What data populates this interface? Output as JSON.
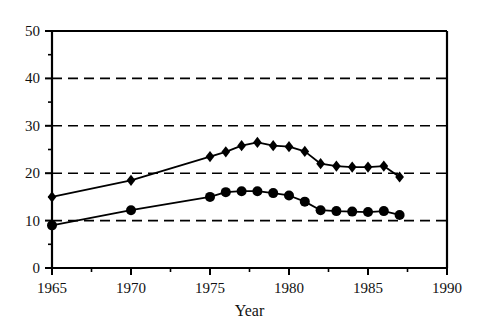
{
  "chart_data": {
    "type": "line",
    "title": "",
    "xlabel": "Year",
    "ylabel": "",
    "xlim": [
      1965,
      1990
    ],
    "ylim": [
      0,
      50
    ],
    "grid": true,
    "gridlines_y": [
      10,
      20,
      30,
      40
    ],
    "legend": "none",
    "xticks": [
      1965,
      1970,
      1975,
      1980,
      1985,
      1990
    ],
    "xtick_labels": [
      "1965",
      "1970",
      "1975",
      "1980",
      "1985",
      "1990"
    ],
    "xminor_ticks": [
      1967.5,
      1972.5,
      1977.5,
      1982.5,
      1987.5
    ],
    "yticks": [
      0,
      10,
      20,
      30,
      40,
      50
    ],
    "ytick_labels": [
      "0",
      "10",
      "20",
      "30",
      "40",
      "50"
    ],
    "yminor_ticks": [
      5,
      15,
      25,
      35,
      45
    ],
    "series": [
      {
        "name": "upper-series",
        "marker": "diamond",
        "color": "#000000",
        "x": [
          1965,
          1970,
          1975,
          1976,
          1977,
          1978,
          1979,
          1980,
          1981,
          1982,
          1983,
          1984,
          1985,
          1986,
          1987
        ],
        "values": [
          15.0,
          18.5,
          23.5,
          24.5,
          25.8,
          26.5,
          25.8,
          25.6,
          24.6,
          22.0,
          21.5,
          21.3,
          21.3,
          21.5,
          19.2
        ]
      },
      {
        "name": "lower-series",
        "marker": "circle",
        "color": "#000000",
        "x": [
          1965,
          1970,
          1975,
          1976,
          1977,
          1978,
          1979,
          1980,
          1981,
          1982,
          1983,
          1984,
          1985,
          1986,
          1987
        ],
        "values": [
          9.0,
          12.2,
          15.0,
          16.0,
          16.2,
          16.2,
          15.8,
          15.3,
          14.0,
          12.2,
          12.0,
          11.9,
          11.8,
          12.0,
          11.2
        ]
      }
    ]
  },
  "axis_titles": {
    "x": "Year"
  }
}
